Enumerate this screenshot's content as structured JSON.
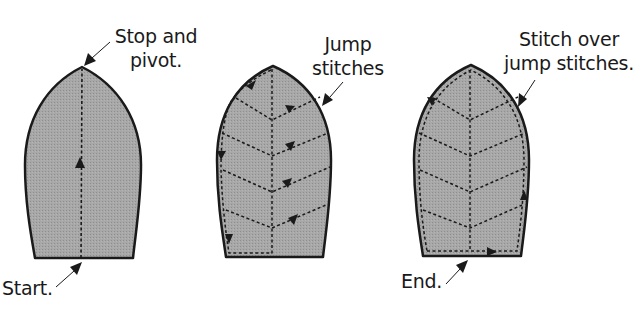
{
  "colors": {
    "leaf_fill": "#a3a3a3",
    "outline": "#1a1a1a",
    "stitch": "#1a1a1a",
    "background": "#ffffff",
    "text": "#1a1a1a"
  },
  "panels": [
    {
      "id": "step-1",
      "labels": {
        "top_line1": "Stop and",
        "top_line2": "pivot.",
        "bottom": "Start."
      }
    },
    {
      "id": "step-2",
      "labels": {
        "top_line1": "Jump",
        "top_line2": "stitches"
      }
    },
    {
      "id": "step-3",
      "labels": {
        "top_line1": "Stitch over",
        "top_line2": "jump stitches.",
        "bottom": "End."
      }
    }
  ]
}
